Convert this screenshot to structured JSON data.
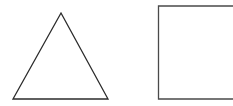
{
  "canvas": {
    "width": 233,
    "height": 106,
    "background_color": "#ffffff",
    "description": "Two unfilled geometric outline shapes side by side on a plain white background"
  },
  "figure": {
    "shape_count": 2,
    "shapes": [
      {
        "id": "triangle",
        "name": "triangle",
        "kind": "polygon",
        "sides": 3,
        "label": "Triangle",
        "fill": "none",
        "stroke_color": "#2b2b2b",
        "stroke_width": 1.3,
        "points": "61,13 108,99 13,99",
        "vertices": [
          {
            "name": "apex",
            "x": 61,
            "y": 13
          },
          {
            "name": "bottom-right",
            "x": 108,
            "y": 99
          },
          {
            "name": "bottom-left",
            "x": 13,
            "y": 99
          }
        ],
        "bbox": {
          "x": 13,
          "y": 13,
          "width": 95,
          "height": 86
        },
        "cropped": false
      },
      {
        "id": "square",
        "name": "square",
        "kind": "polyline",
        "sides": 4,
        "label": "Square",
        "fill": "none",
        "stroke_color": "#4a4a4a",
        "stroke_width": 1.3,
        "points": "233,6 158.5,6 158.5,99 233,99",
        "vertices": [
          {
            "name": "top-right-offscreen",
            "x": 233,
            "y": 6
          },
          {
            "name": "top-left",
            "x": 158.5,
            "y": 6
          },
          {
            "name": "bottom-left",
            "x": 158.5,
            "y": 99
          },
          {
            "name": "bottom-right-offscreen",
            "x": 233,
            "y": 99
          }
        ],
        "bbox": {
          "x": 158,
          "y": 6,
          "width": 75,
          "height": 93
        },
        "cropped": true,
        "cropped_edge": "right"
      }
    ]
  }
}
